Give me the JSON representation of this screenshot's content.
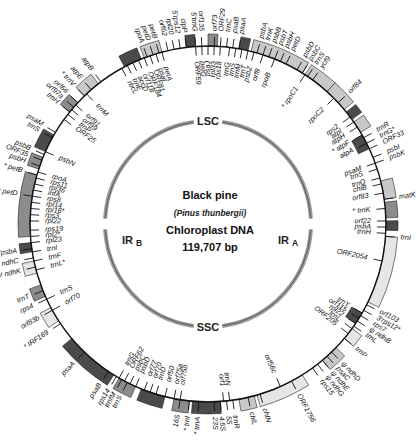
{
  "center": {
    "title": "Black pine",
    "species": "(Pinus thunbergii)",
    "molecule": "Chloroplast DNA",
    "size": "119,707 bp"
  },
  "regions": {
    "lsc": "LSC",
    "ssc": "SSC",
    "ir_a": "IR",
    "ir_a_sub": "A",
    "ir_b": "IR",
    "ir_b_sub": "B"
  },
  "colors": {
    "ring_line": "#111111",
    "inner_ring": "#9a9a9a",
    "block_dark": "#4a4a4a",
    "block_mid": "#8c8c8c",
    "block_light": "#c8c8c8",
    "block_pale": "#e6e6e6"
  },
  "geometry": {
    "cx": 208,
    "cy": 224,
    "outer_r": 178,
    "inner_r": 103
  },
  "outer_labels": [
    {
      "text": "psbA",
      "angle": -74,
      "side": "out"
    },
    {
      "text": "trnK",
      "angle": -72,
      "side": "out"
    },
    {
      "text": "psbB",
      "angle": -70,
      "side": "out"
    },
    {
      "text": "psbT",
      "angle": -68,
      "side": "out"
    },
    {
      "text": "psbH",
      "angle": -66,
      "side": "out"
    },
    {
      "text": "petD",
      "angle": -64,
      "side": "out"
    },
    {
      "text": "psbD",
      "angle": -60,
      "side": "out"
    },
    {
      "text": "psbC",
      "angle": -58,
      "side": "out"
    },
    {
      "text": "trnS",
      "angle": -56,
      "side": "out"
    },
    {
      "text": "ycf9",
      "angle": -54,
      "side": "out"
    },
    {
      "text": "psaA",
      "angle": -80,
      "side": "out"
    },
    {
      "text": "psaB",
      "angle": -82,
      "side": "out"
    },
    {
      "text": "atpB",
      "angle": -127,
      "side": "out"
    },
    {
      "text": "atpE",
      "angle": -131,
      "side": "out"
    },
    {
      "text": "* trnV",
      "angle": -134,
      "side": "out"
    },
    {
      "text": "orf66",
      "angle": -137,
      "side": "out"
    },
    {
      "text": "orf97a",
      "angle": -139,
      "side": "out"
    },
    {
      "text": "trnH",
      "angle": -141,
      "side": "out"
    },
    {
      "text": "psaM",
      "angle": -149,
      "side": "out"
    },
    {
      "text": "trnS",
      "angle": -151,
      "side": "out"
    },
    {
      "text": "psbB",
      "angle": -157,
      "side": "out"
    },
    {
      "text": "ORF35",
      "angle": -159,
      "side": "out"
    },
    {
      "text": "psbH",
      "angle": -161,
      "side": "out"
    },
    {
      "text": "* petB",
      "angle": -164,
      "side": "out"
    },
    {
      "text": "* petD",
      "angle": -171,
      "side": "out"
    },
    {
      "text": "3'psbA",
      "angle": 172,
      "side": "out"
    },
    {
      "text": "Ψ ndhC",
      "angle": 169,
      "side": "out"
    },
    {
      "text": "Ψ ndhK",
      "angle": 166,
      "side": "out"
    },
    {
      "text": "trnT",
      "angle": 158,
      "side": "out"
    },
    {
      "text": "rps4",
      "angle": 155,
      "side": "out"
    },
    {
      "text": "orf83b",
      "angle": 151,
      "side": "out"
    },
    {
      "text": "* IRF169",
      "angle": 146,
      "side": "out"
    },
    {
      "text": "psaA",
      "angle": 134,
      "side": "out"
    },
    {
      "text": "psaB",
      "angle": 124,
      "side": "out"
    },
    {
      "text": "rps14",
      "angle": 121,
      "side": "out"
    },
    {
      "text": "trnfM",
      "angle": 119,
      "side": "out"
    },
    {
      "text": "trnS",
      "angle": 117,
      "side": "out"
    },
    {
      "text": "16S",
      "angle": 99,
      "side": "out"
    },
    {
      "text": "* trnI",
      "angle": 96,
      "side": "out"
    },
    {
      "text": "* trnA",
      "angle": 93,
      "side": "out"
    },
    {
      "text": "23S",
      "angle": 88,
      "side": "out"
    },
    {
      "text": "4.5S",
      "angle": 86,
      "side": "out"
    },
    {
      "text": "5S",
      "angle": 84,
      "side": "out"
    },
    {
      "text": "trnR",
      "angle": 82,
      "side": "out"
    },
    {
      "text": "chlL",
      "angle": 77,
      "side": "out"
    },
    {
      "text": "chlN",
      "angle": 73,
      "side": "out"
    },
    {
      "text": "ORF1756",
      "angle": 62,
      "side": "out"
    },
    {
      "text": "trnP",
      "angle": 40,
      "side": "out"
    },
    {
      "text": "ψ ndhD",
      "angle": 46,
      "side": "out"
    },
    {
      "text": "psaC",
      "angle": 48,
      "side": "out"
    },
    {
      "text": "ψ ndhE",
      "angle": 50,
      "side": "out"
    },
    {
      "text": "ψ ndhG",
      "angle": 52,
      "side": "out"
    },
    {
      "text": "rps15",
      "angle": 54,
      "side": "out"
    },
    {
      "text": "orf103",
      "angle": 27,
      "side": "out"
    },
    {
      "text": "3'rps12*",
      "angle": 29,
      "side": "out"
    },
    {
      "text": "rps7",
      "angle": 31,
      "side": "out"
    },
    {
      "text": "ψ ndhB",
      "angle": 33,
      "side": "out"
    },
    {
      "text": "trnL",
      "angle": 35,
      "side": "out"
    },
    {
      "text": "trnI",
      "angle": 4,
      "side": "out"
    },
    {
      "text": "matK",
      "angle": -8,
      "side": "out"
    },
    {
      "text": "psbK",
      "angle": -20,
      "side": "out"
    },
    {
      "text": "psbI",
      "angle": -22,
      "side": "out"
    },
    {
      "text": "ORF33",
      "angle": -25,
      "side": "out"
    },
    {
      "text": "trnG*",
      "angle": -27,
      "side": "out"
    },
    {
      "text": "trnR",
      "angle": -29,
      "side": "out"
    },
    {
      "text": "orf84",
      "angle": -43,
      "side": "out"
    },
    {
      "text": "trnC",
      "angle": -84,
      "side": "out"
    },
    {
      "text": "ORF29",
      "angle": -86,
      "side": "out"
    },
    {
      "text": "orf73",
      "angle": -88,
      "side": "out"
    },
    {
      "text": "orf135",
      "angle": -92,
      "side": "out"
    },
    {
      "text": "5'trnG",
      "angle": -94,
      "side": "out"
    },
    {
      "text": "clpP",
      "angle": -97,
      "side": "out"
    },
    {
      "text": "5'rps12",
      "angle": -99,
      "side": "out"
    },
    {
      "text": "rpl20",
      "angle": -101,
      "side": "out"
    },
    {
      "text": "orf62",
      "angle": -103,
      "side": "out"
    },
    {
      "text": "petB",
      "angle": -106,
      "side": "out"
    },
    {
      "text": "petD",
      "angle": -108,
      "side": "out"
    },
    {
      "text": "rpoA",
      "angle": -110,
      "side": "out"
    }
  ],
  "inner_labels": [
    {
      "text": "rpoB",
      "angle": -68,
      "side": "in"
    },
    {
      "text": "* rpoC1",
      "angle": -57,
      "side": "in"
    },
    {
      "text": "rpoC2",
      "angle": -45,
      "side": "in"
    },
    {
      "text": "rps2",
      "angle": -37,
      "side": "in"
    },
    {
      "text": "atpI",
      "angle": -35,
      "side": "in"
    },
    {
      "text": "atpH",
      "angle": -33,
      "side": "in"
    },
    {
      "text": "* atpF",
      "angle": -30,
      "side": "in"
    },
    {
      "text": "atpA",
      "angle": -27,
      "side": "in"
    },
    {
      "text": "psaM",
      "angle": -20,
      "side": "in"
    },
    {
      "text": "trnS",
      "angle": -18,
      "side": "in"
    },
    {
      "text": "trnQ",
      "angle": -15,
      "side": "in"
    },
    {
      "text": "chlB",
      "angle": -13,
      "side": "in"
    },
    {
      "text": "orf83",
      "angle": -10,
      "side": "in"
    },
    {
      "text": "* trnK",
      "angle": -5,
      "side": "in"
    },
    {
      "text": "orf22",
      "angle": -1,
      "side": "in"
    },
    {
      "text": "psbA",
      "angle": 1,
      "side": "in"
    },
    {
      "text": "trnH",
      "angle": 3,
      "side": "in"
    },
    {
      "text": "ORF2054",
      "angle": 12,
      "side": "in"
    },
    {
      "text": "trnY",
      "angle": 30,
      "side": "in"
    },
    {
      "text": "orf115",
      "angle": 32,
      "side": "in"
    },
    {
      "text": "rpl22",
      "angle": 34,
      "side": "in"
    },
    {
      "text": "trnL",
      "angle": 36,
      "side": "in"
    },
    {
      "text": "ORF205",
      "angle": 38,
      "side": "in"
    },
    {
      "text": "orf56c",
      "angle": 66,
      "side": "in"
    },
    {
      "text": "trnN",
      "angle": 83,
      "side": "in"
    },
    {
      "text": "orf1",
      "angle": 85,
      "side": "in"
    },
    {
      "text": "orf75b",
      "angle": 99,
      "side": "in"
    },
    {
      "text": "orf75a",
      "angle": 101,
      "side": "in"
    },
    {
      "text": "orf50",
      "angle": 104,
      "side": "in"
    },
    {
      "text": "trnD",
      "angle": 107,
      "side": "in"
    },
    {
      "text": "orf70",
      "angle": 109,
      "side": "in"
    },
    {
      "text": "orf77",
      "angle": 111,
      "side": "in"
    },
    {
      "text": "psbD",
      "angle": 114,
      "side": "in"
    },
    {
      "text": "psbC",
      "angle": 116,
      "side": "in"
    },
    {
      "text": "ORF62",
      "angle": 118,
      "side": "in"
    },
    {
      "text": "trnG",
      "angle": 120,
      "side": "in"
    },
    {
      "text": "orf70",
      "angle": 151,
      "side": "in"
    },
    {
      "text": "trnS",
      "angle": 155,
      "side": "in"
    },
    {
      "text": "trnL*",
      "angle": 165,
      "side": "in"
    },
    {
      "text": "trnF",
      "angle": 168,
      "side": "in"
    },
    {
      "text": "trnI",
      "angle": 171,
      "side": "in"
    },
    {
      "text": "rpl23",
      "angle": 174,
      "side": "in"
    },
    {
      "text": "rpl2*",
      "angle": 176,
      "side": "in"
    },
    {
      "text": "rps19",
      "angle": 178,
      "side": "in"
    },
    {
      "text": "rpl22",
      "angle": -179,
      "side": "in"
    },
    {
      "text": "rps3",
      "angle": -177,
      "side": "in"
    },
    {
      "text": "rpl16*",
      "angle": -175,
      "side": "in"
    },
    {
      "text": "rpl14",
      "angle": -173,
      "side": "in"
    },
    {
      "text": "rps8",
      "angle": -171,
      "side": "in"
    },
    {
      "text": "infA",
      "angle": -169,
      "side": "in"
    },
    {
      "text": "rpl36",
      "angle": -167,
      "side": "in"
    },
    {
      "text": "rps11",
      "angle": -165,
      "side": "in"
    },
    {
      "text": "rpoA",
      "angle": -163,
      "side": "in"
    },
    {
      "text": "psbN",
      "angle": -156,
      "side": "in"
    },
    {
      "text": "ORF25",
      "angle": -144,
      "side": "in"
    },
    {
      "text": "trnP",
      "angle": -142,
      "side": "in"
    },
    {
      "text": "orf99",
      "angle": -140,
      "side": "in"
    },
    {
      "text": "orf91",
      "angle": -138,
      "side": "in"
    },
    {
      "text": "trnM",
      "angle": -133,
      "side": "in"
    },
    {
      "text": "rbcL",
      "angle": -119,
      "side": "in"
    },
    {
      "text": "trnE",
      "angle": -117,
      "side": "in"
    },
    {
      "text": "accD",
      "angle": -115,
      "side": "in"
    },
    {
      "text": "orf118",
      "angle": -113,
      "side": "in"
    },
    {
      "text": "ORF184",
      "angle": -111,
      "side": "in"
    },
    {
      "text": "ORF81",
      "angle": -109,
      "side": "in"
    },
    {
      "text": "psaI",
      "angle": -107,
      "side": "in"
    },
    {
      "text": "petA",
      "angle": -105,
      "side": "in"
    },
    {
      "text": "ORF59",
      "angle": -94,
      "side": "in"
    },
    {
      "text": "petG",
      "angle": -92,
      "side": "in"
    },
    {
      "text": "psaJ",
      "angle": -90,
      "side": "in"
    },
    {
      "text": "rpl33",
      "angle": -88,
      "side": "in"
    },
    {
      "text": "rps18",
      "angle": -86,
      "side": "in"
    },
    {
      "text": "trnG",
      "angle": -83,
      "side": "in"
    },
    {
      "text": "trnS",
      "angle": -81,
      "side": "in"
    },
    {
      "text": "trnM",
      "angle": -79,
      "side": "in"
    },
    {
      "text": "trnT",
      "angle": -77,
      "side": "in"
    },
    {
      "text": "psbZ",
      "angle": -75,
      "side": "in"
    },
    {
      "text": "orf8",
      "angle": -72,
      "side": "in"
    }
  ],
  "blocks": [
    {
      "start": -76,
      "end": -58,
      "r": "out",
      "shade": "block_light"
    },
    {
      "start": -57,
      "end": -48,
      "r": "out",
      "shade": "block_light"
    },
    {
      "start": -48,
      "end": -40,
      "r": "out",
      "shade": "block_light"
    },
    {
      "start": -39,
      "end": -36,
      "r": "out",
      "shade": "block_dark"
    },
    {
      "start": -35,
      "end": -31,
      "r": "out",
      "shade": "block_light"
    },
    {
      "start": -30,
      "end": -25,
      "r": "in",
      "shade": "block_dark"
    },
    {
      "start": -14,
      "end": -8,
      "r": "out",
      "shade": "block_light"
    },
    {
      "start": -7,
      "end": -2,
      "r": "out",
      "shade": "block_mid"
    },
    {
      "start": -1,
      "end": 2,
      "r": "out",
      "shade": "block_dark"
    },
    {
      "start": 4,
      "end": 26,
      "r": "out",
      "shade": "block_pale"
    },
    {
      "start": 30,
      "end": 34,
      "r": "in",
      "shade": "block_dark"
    },
    {
      "start": 36,
      "end": 40,
      "r": "out",
      "shade": "block_pale"
    },
    {
      "start": 44,
      "end": 50,
      "r": "out",
      "shade": "block_light"
    },
    {
      "start": 58,
      "end": 74,
      "r": "out",
      "shade": "block_pale"
    },
    {
      "start": 75,
      "end": 80,
      "r": "out",
      "shade": "block_light"
    },
    {
      "start": 86,
      "end": 95,
      "r": "out",
      "shade": "block_dark"
    },
    {
      "start": 96,
      "end": 101,
      "r": "out",
      "shade": "block_mid"
    },
    {
      "start": 104,
      "end": 112,
      "r": "out",
      "shade": "block_dark"
    },
    {
      "start": 114,
      "end": 120,
      "r": "out",
      "shade": "block_mid"
    },
    {
      "start": 122,
      "end": 140,
      "r": "out",
      "shade": "block_dark"
    },
    {
      "start": 147,
      "end": 152,
      "r": "out",
      "shade": "block_pale"
    },
    {
      "start": 156,
      "end": 160,
      "r": "out",
      "shade": "block_mid"
    },
    {
      "start": 164,
      "end": 168,
      "r": "out",
      "shade": "block_pale"
    },
    {
      "start": 171,
      "end": 174,
      "r": "out",
      "shade": "block_dark"
    },
    {
      "start": 176,
      "end": 196,
      "r": "out",
      "shade": "block_mid"
    },
    {
      "start": -162,
      "end": -158,
      "r": "out",
      "shade": "block_mid"
    },
    {
      "start": -156,
      "end": -150,
      "r": "out",
      "shade": "block_dark"
    },
    {
      "start": -141,
      "end": -137,
      "r": "out",
      "shade": "block_mid"
    },
    {
      "start": -134,
      "end": -128,
      "r": "out",
      "shade": "block_light"
    },
    {
      "start": -118,
      "end": -112,
      "r": "out",
      "shade": "block_dark"
    },
    {
      "start": -111,
      "end": -105,
      "r": "out",
      "shade": "block_light"
    },
    {
      "start": -97,
      "end": -94,
      "r": "out",
      "shade": "block_dark"
    },
    {
      "start": -90,
      "end": -87,
      "r": "out",
      "shade": "block_mid"
    },
    {
      "start": -80,
      "end": -77,
      "r": "out",
      "shade": "block_dark"
    }
  ]
}
